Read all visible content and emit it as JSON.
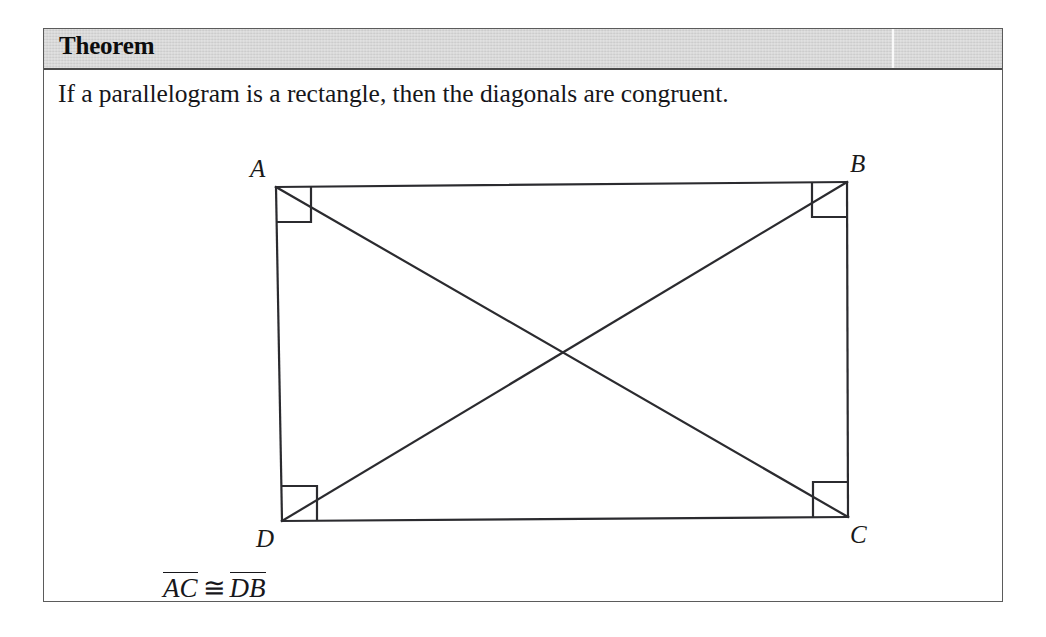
{
  "theorem": {
    "title": "Theorem",
    "statement": "If a parallelogram is a rectangle, then the diagonals are congruent.",
    "conclusion": {
      "segment_left": "AC",
      "congruent_symbol": "≅",
      "segment_right": "DB"
    }
  },
  "figure": {
    "name": "rectangle-with-congruent-diagonals",
    "shape": "rectangle",
    "vertices": [
      {
        "label": "A",
        "x": 232,
        "y": 88,
        "label_x": 206,
        "label_y": 78
      },
      {
        "label": "B",
        "x": 803,
        "y": 83,
        "label_x": 806,
        "label_y": 73
      },
      {
        "label": "C",
        "x": 804,
        "y": 418,
        "label_x": 806,
        "label_y": 444
      },
      {
        "label": "D",
        "x": 238,
        "y": 422,
        "label_x": 212,
        "label_y": 448
      }
    ],
    "sides": [
      {
        "name": "AB",
        "from": "A",
        "to": "B"
      },
      {
        "name": "BC",
        "from": "B",
        "to": "C"
      },
      {
        "name": "CD",
        "from": "C",
        "to": "D"
      },
      {
        "name": "DA",
        "from": "D",
        "to": "A"
      }
    ],
    "diagonals": [
      {
        "name": "AC",
        "from": "A",
        "to": "C"
      },
      {
        "name": "DB",
        "from": "D",
        "to": "B"
      }
    ],
    "diagonal_intersection": {
      "x": 522,
      "y": 253
    },
    "right_angle_markers": [
      "A",
      "B",
      "C",
      "D"
    ],
    "right_angle_marker_size": 35,
    "stroke_color": "#2b2b2f",
    "stroke_width": 2.2
  },
  "colors": {
    "page_background": "#ffffff",
    "box_border": "#5b5b5b",
    "header_background": "#d6d6d6",
    "header_rule": "#4a4a4a",
    "text": "#16161a",
    "figure_stroke": "#2b2b2f"
  }
}
